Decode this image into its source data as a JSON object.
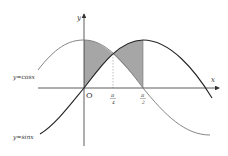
{
  "figure": {
    "axis_labels": {
      "x": "x",
      "y": "y",
      "origin": "O"
    },
    "ticks": [
      {
        "num": "π",
        "den": "4"
      },
      {
        "num": "π",
        "den": "2"
      }
    ],
    "curves": [
      {
        "label": "y=cosx",
        "color": "#777777"
      },
      {
        "label": "y=sinx",
        "color": "#222222"
      }
    ],
    "shading": {
      "color": "#a6a6a6",
      "from": "0",
      "to": "π/2"
    }
  }
}
